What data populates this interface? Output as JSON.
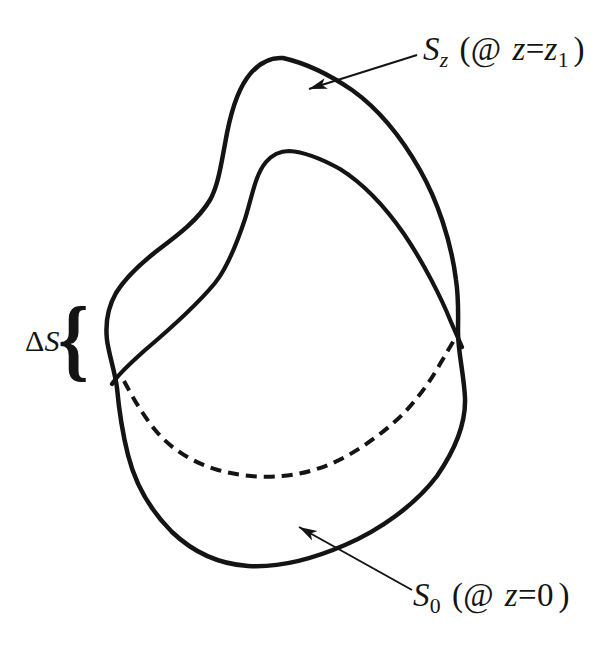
{
  "figure": {
    "background": "#ffffff",
    "ink_color": "#141414",
    "kind": "surface-diagram"
  },
  "curves": {
    "outer_silhouette": "solid closed outline of volume",
    "upper_surface_front_rim": "solid arc (front edge of S_z cap)",
    "lower_surface_hidden_rim": "dashed arc (hidden back edge of S_0 cap)"
  },
  "labels": {
    "upper_surface": {
      "symbol": "S",
      "subscript": "z",
      "annotation_open": "(@",
      "variable": "z",
      "equals": "=",
      "value_symbol": "z",
      "value_subscript": "1",
      "annotation_close": ")"
    },
    "lower_surface": {
      "symbol": "S",
      "subscript": "0",
      "annotation_open": "(@",
      "variable": "z",
      "equals": "=",
      "value": "0",
      "annotation_close": ")"
    },
    "side_strip": {
      "delta": "Δ",
      "symbol": "S",
      "brace": "{"
    }
  }
}
